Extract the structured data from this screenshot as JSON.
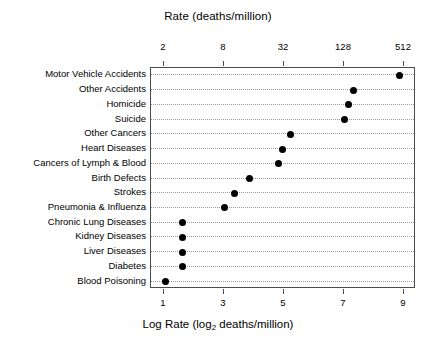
{
  "chart_data": {
    "type": "scatter",
    "title": "Rate (deaths/million)",
    "xlabel": "Log Rate (log_2 deaths/million)",
    "ylabel": "",
    "orientation": "horizontal",
    "grid": true,
    "legend": null,
    "xlim": [
      0.55,
      9.4
    ],
    "top_axis": {
      "label": "Rate (deaths/million)",
      "tick_labels": [
        "2",
        "8",
        "32",
        "128",
        "512"
      ],
      "tick_values": [
        1,
        3,
        5,
        7,
        9
      ],
      "scale": "log2"
    },
    "bottom_axis": {
      "label_prefix": "Log Rate (log",
      "label_sub": "2",
      "label_suffix": " deaths/million)",
      "tick_labels": [
        "1",
        "3",
        "5",
        "7",
        "9"
      ],
      "tick_values": [
        1,
        3,
        5,
        7,
        9
      ]
    },
    "categories": [
      "Motor Vehicle Accidents",
      "Other Accidents",
      "Homicide",
      "Suicide",
      "Other Cancers",
      "Heart Diseases",
      "Cancers of Lymph & Blood",
      "Birth Defects",
      "Strokes",
      "Pneumonia & Influenza",
      "Chronic Lung Diseases",
      "Kidney Diseases",
      "Liver Diseases",
      "Diabetes",
      "Blood Poisoning"
    ],
    "values": [
      8.85,
      7.3,
      7.15,
      7.0,
      5.2,
      4.95,
      4.8,
      3.85,
      3.35,
      3.0,
      1.6,
      1.6,
      1.6,
      1.6,
      1.05
    ],
    "points": [
      {
        "category": "Motor Vehicle Accidents",
        "log_rate": 8.85,
        "rate": 461
      },
      {
        "category": "Other Accidents",
        "log_rate": 7.3,
        "rate": 158
      },
      {
        "category": "Homicide",
        "log_rate": 7.15,
        "rate": 142
      },
      {
        "category": "Suicide",
        "log_rate": 7.0,
        "rate": 128
      },
      {
        "category": "Other Cancers",
        "log_rate": 5.2,
        "rate": 37
      },
      {
        "category": "Heart Diseases",
        "log_rate": 4.95,
        "rate": 31
      },
      {
        "category": "Cancers of Lymph & Blood",
        "log_rate": 4.8,
        "rate": 28
      },
      {
        "category": "Birth Defects",
        "log_rate": 3.85,
        "rate": 14
      },
      {
        "category": "Strokes",
        "log_rate": 3.35,
        "rate": 10
      },
      {
        "category": "Pneumonia & Influenza",
        "log_rate": 3.0,
        "rate": 8
      },
      {
        "category": "Chronic Lung Diseases",
        "log_rate": 1.6,
        "rate": 3
      },
      {
        "category": "Kidney Diseases",
        "log_rate": 1.6,
        "rate": 3
      },
      {
        "category": "Liver Diseases",
        "log_rate": 1.6,
        "rate": 3
      },
      {
        "category": "Diabetes",
        "log_rate": 1.6,
        "rate": 3
      },
      {
        "category": "Blood Poisoning",
        "log_rate": 1.05,
        "rate": 2
      }
    ],
    "colors": {
      "point": "#000000",
      "frame": "#4d4d4d",
      "grid": "#9a9a9a",
      "background": "#ffffff",
      "text": "#000000"
    }
  }
}
